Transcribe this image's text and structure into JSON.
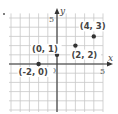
{
  "chart_data": {
    "type": "scatter",
    "title": "",
    "xlabel": "x",
    "ylabel": "y",
    "xlim": [
      -5,
      5
    ],
    "ylim": [
      -5,
      5.5
    ],
    "grid": true,
    "tick_labels": {
      "x": "5",
      "y": "5",
      "origin": "0"
    },
    "points": [
      {
        "x": -2,
        "y": 0,
        "label": "(-2, 0)",
        "label_pos": "below-left"
      },
      {
        "x": 0,
        "y": 1,
        "label": "(0, 1)",
        "label_pos": "left"
      },
      {
        "x": 2,
        "y": 2,
        "label": "(2, 2)",
        "label_pos": "below"
      },
      {
        "x": 4,
        "y": 3,
        "label": "(4, 3)",
        "label_pos": "above-left"
      }
    ]
  },
  "colors": {
    "grid": "#c8c8c8",
    "axis": "#333333",
    "point": "#333333",
    "text": "#444444"
  }
}
